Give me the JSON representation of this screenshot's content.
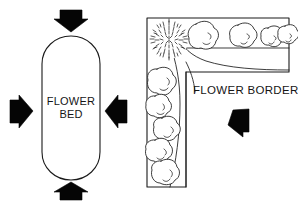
{
  "figure": {
    "background_color": "#ffffff",
    "ink_color": "#1a1a1a",
    "arrow_color": "#050505",
    "width": 298,
    "height": 205
  },
  "panels": [
    {
      "id": "flower-bed",
      "label": "FLOWER BED",
      "label_line_1": "FLOWER",
      "label_line_2": "BED",
      "shape": "stadium",
      "description": "Free-standing oval bed viewed from all sides",
      "arrow_count": 4,
      "arrows": [
        {
          "name": "arrow-top",
          "direction": "down",
          "points_toward": "bed"
        },
        {
          "name": "arrow-right",
          "direction": "left",
          "points_toward": "bed"
        },
        {
          "name": "arrow-bottom",
          "direction": "up",
          "points_toward": "bed"
        },
        {
          "name": "arrow-left",
          "direction": "right",
          "points_toward": "bed"
        }
      ]
    },
    {
      "id": "flower-border",
      "label": "FLOWER BORDER",
      "shape": "l-shaped-strip",
      "description": "Border backed by walls, viewed from one side only",
      "arrow_count": 1,
      "arrows": [
        {
          "name": "arrow-border",
          "direction": "left",
          "points_toward": "border"
        }
      ],
      "plantings": {
        "corner_specimen": {
          "name": "stippled-corner-shrub",
          "count": 1,
          "style": "dense stipple texture"
        },
        "top_row_shrubs": {
          "name": "top-row-shrub",
          "count": 4,
          "style": "outlined rounded shrub"
        },
        "left_column_shrubs": {
          "name": "left-column-shrub",
          "count": 5,
          "style": "outlined rounded shrub"
        }
      },
      "lawn_edge": "curved sweep from corner"
    }
  ]
}
